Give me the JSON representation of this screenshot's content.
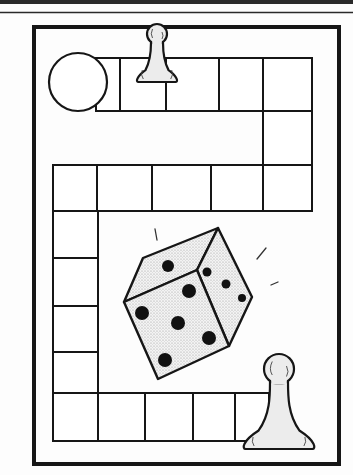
{
  "illustration": {
    "title": "Board game illustration",
    "colors": {
      "ink": "#161616",
      "paper": "#fdfdfd",
      "shade": "#dcdcdc",
      "pawn_fill": "#e6e6e6"
    }
  },
  "header_rules": [
    {
      "y": 2,
      "thickness": 4
    },
    {
      "y": 12.5,
      "thickness": 1.5
    }
  ],
  "frame": {
    "x": 34,
    "y": 27,
    "w": 305,
    "h": 437,
    "stroke": 4
  },
  "start_circle": {
    "cx": 78,
    "cy": 82,
    "r": 29
  },
  "track_cells": [
    {
      "x": 96,
      "y": 58,
      "w": 24,
      "h": 53
    },
    {
      "x": 120,
      "y": 58,
      "w": 46,
      "h": 53
    },
    {
      "x": 166,
      "y": 58,
      "w": 53,
      "h": 53
    },
    {
      "x": 219,
      "y": 58,
      "w": 44,
      "h": 53
    },
    {
      "x": 263,
      "y": 58,
      "w": 49,
      "h": 53
    },
    {
      "x": 263,
      "y": 111,
      "w": 49,
      "h": 54
    },
    {
      "x": 263,
      "y": 165,
      "w": 49,
      "h": 46
    },
    {
      "x": 211,
      "y": 165,
      "w": 52,
      "h": 46
    },
    {
      "x": 152,
      "y": 165,
      "w": 59,
      "h": 46
    },
    {
      "x": 97,
      "y": 165,
      "w": 55,
      "h": 46
    },
    {
      "x": 53,
      "y": 165,
      "w": 44,
      "h": 46
    },
    {
      "x": 53,
      "y": 211,
      "w": 45,
      "h": 47
    },
    {
      "x": 53,
      "y": 258,
      "w": 45,
      "h": 48
    },
    {
      "x": 53,
      "y": 306,
      "w": 45,
      "h": 46
    },
    {
      "x": 53,
      "y": 352,
      "w": 45,
      "h": 41
    },
    {
      "x": 53,
      "y": 393,
      "w": 45,
      "h": 48
    },
    {
      "x": 98,
      "y": 393,
      "w": 47,
      "h": 48
    },
    {
      "x": 145,
      "y": 393,
      "w": 48,
      "h": 48
    },
    {
      "x": 193,
      "y": 393,
      "w": 42,
      "h": 48
    },
    {
      "x": 235,
      "y": 393,
      "w": 34,
      "h": 48
    }
  ],
  "die": {
    "top_face": [
      [
        143,
        258
      ],
      [
        218,
        228
      ],
      [
        197,
        270
      ],
      [
        124,
        302
      ]
    ],
    "front_face": [
      [
        124,
        302
      ],
      [
        197,
        270
      ],
      [
        229,
        346
      ],
      [
        158,
        379
      ]
    ],
    "right_face": [
      [
        218,
        228
      ],
      [
        252,
        297
      ],
      [
        229,
        346
      ],
      [
        197,
        270
      ]
    ],
    "pips": [
      {
        "cx": 168,
        "cy": 266,
        "r": 6
      },
      {
        "cx": 189,
        "cy": 291,
        "r": 7
      },
      {
        "cx": 142,
        "cy": 313,
        "r": 7
      },
      {
        "cx": 178,
        "cy": 323,
        "r": 7
      },
      {
        "cx": 209,
        "cy": 338,
        "r": 7
      },
      {
        "cx": 165,
        "cy": 360,
        "r": 7
      },
      {
        "cx": 207,
        "cy": 272,
        "r": 4.5
      },
      {
        "cx": 226,
        "cy": 284,
        "r": 4.5
      },
      {
        "cx": 242,
        "cy": 298,
        "r": 4
      }
    ],
    "motion_marks": [
      [
        [
          155,
          229
        ],
        [
          157,
          240
        ]
      ],
      [
        [
          257,
          259
        ],
        [
          266,
          248
        ]
      ],
      [
        [
          271,
          285
        ],
        [
          278,
          282
        ]
      ]
    ]
  },
  "pawns": [
    {
      "name": "top-pawn",
      "cx": 157,
      "head_cy": 34,
      "head_r": 10,
      "neck_y": 48,
      "neck_hw": 6,
      "base_y": 82,
      "base_hw": 21
    },
    {
      "name": "bottom-pawn",
      "cx": 279,
      "head_cy": 369,
      "head_r": 15,
      "neck_y": 396,
      "neck_hw": 9,
      "base_y": 449,
      "base_hw": 37
    }
  ]
}
